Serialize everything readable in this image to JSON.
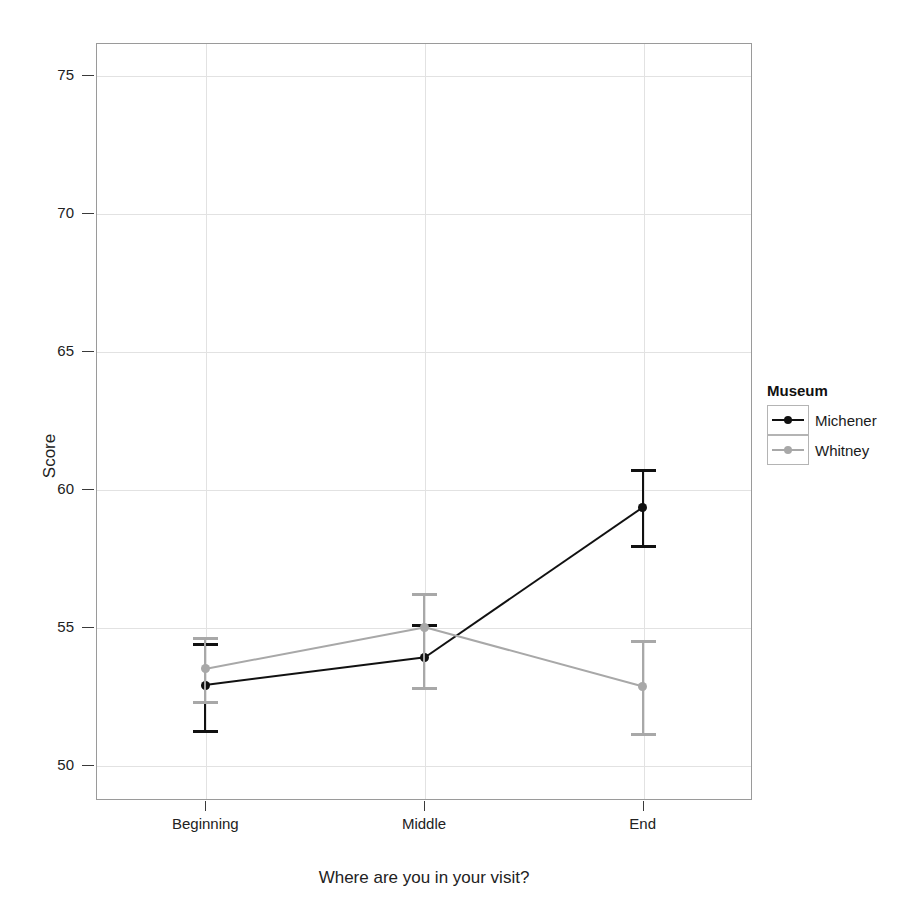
{
  "chart_data": {
    "type": "line",
    "title": "",
    "xlabel": "Where are you in your visit?",
    "ylabel": "Score",
    "categories": [
      "Beginning",
      "Middle",
      "End"
    ],
    "ylim": [
      48.75,
      76.15
    ],
    "yticks": [
      50,
      55,
      60,
      65,
      70,
      75
    ],
    "ytick_labels": [
      "50",
      "55",
      "60",
      "65",
      "70",
      "75"
    ],
    "grid": true,
    "legend_title": "Museum",
    "legend_position": "right",
    "series": [
      {
        "name": "Michener",
        "color": "#111111",
        "values": [
          52.9,
          53.9,
          59.35
        ],
        "error_low": [
          51.25,
          52.8,
          57.95
        ],
        "error_high": [
          54.4,
          55.1,
          60.7
        ]
      },
      {
        "name": "Whitney",
        "color": "#a8a8a8",
        "values": [
          53.5,
          55.0,
          52.85
        ],
        "error_low": [
          52.3,
          52.8,
          51.15
        ],
        "error_high": [
          54.6,
          56.2,
          54.5
        ]
      }
    ]
  },
  "axes": {
    "y_title": "Score",
    "x_title": "Where are you in your visit?"
  },
  "legend": {
    "title": "Museum",
    "items": [
      {
        "label": "Michener",
        "color": "#111111"
      },
      {
        "label": "Whitney",
        "color": "#a8a8a8"
      }
    ]
  },
  "colors": {
    "michener": "#111111",
    "whitney": "#a8a8a8",
    "panel_border": "#9a9a9a",
    "gridline": "#e2e2e2",
    "text": "#1a1a1a"
  }
}
